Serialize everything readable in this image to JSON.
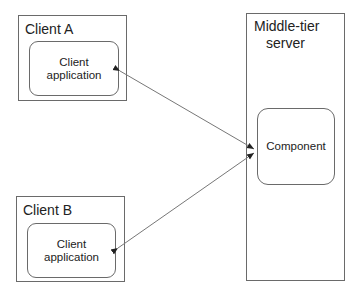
{
  "client_a": {
    "title": "Client A",
    "app_line1": "Client",
    "app_line2": "application"
  },
  "client_b": {
    "title": "Client B",
    "app_line1": "Client",
    "app_line2": "application"
  },
  "server": {
    "title_line1": "Middle-tier",
    "title_line2": "server",
    "component": "Component"
  },
  "connections": [
    {
      "from": "Client A application",
      "to": "Component",
      "type": "bidirectional"
    },
    {
      "from": "Client B application",
      "to": "Component",
      "type": "bidirectional"
    }
  ]
}
